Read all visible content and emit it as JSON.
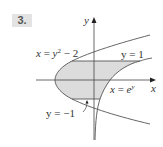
{
  "problem": {
    "number": "3."
  },
  "axes": {
    "x_label": "x",
    "y_label": "y"
  },
  "labels": {
    "parabola": {
      "lhs": "x",
      "eq": " = ",
      "var": "y",
      "exp": "2",
      "rest": " − 2"
    },
    "line_top": {
      "lhs": "y",
      "rest": " = 1"
    },
    "exp_curve": {
      "lhs": "x",
      "eq": " = ",
      "base": "e",
      "exp": "y"
    },
    "line_bottom": {
      "lhs": "y",
      "rest": " = −1"
    }
  },
  "colors": {
    "curve": "#555555",
    "axis": "#444444",
    "shade": "#dcdcdc",
    "label_bg": "#e3e3e3"
  }
}
